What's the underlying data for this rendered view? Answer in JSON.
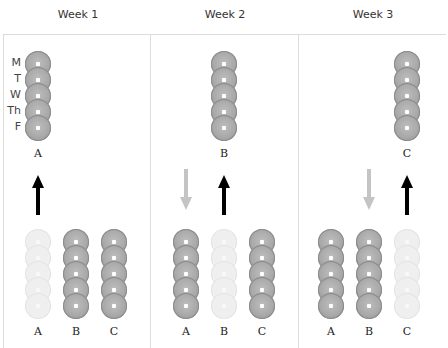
{
  "weeks": [
    {
      "title": "Week 1",
      "offsite_set": "A",
      "incoming_set": null,
      "outgoing_set": "A"
    },
    {
      "title": "Week 2",
      "offsite_set": "B",
      "incoming_set": "A",
      "outgoing_set": "B"
    },
    {
      "title": "Week 3",
      "offsite_set": "C",
      "incoming_set": "B",
      "outgoing_set": "C"
    }
  ],
  "days": [
    "M",
    "T",
    "W",
    "Th",
    "F"
  ],
  "set_labels": [
    "A",
    "B",
    "C"
  ],
  "colors": {
    "disc": "#a9a9a9",
    "disc_faded": "#efefef",
    "arrow_out": "#000000",
    "arrow_in": "#c4c4c4",
    "border": "#dcdcdc"
  }
}
